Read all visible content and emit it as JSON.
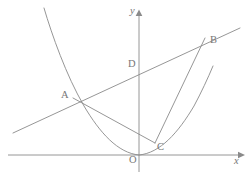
{
  "figure": {
    "background_color": "#ffffff",
    "stroke_color": "#8a8a8a",
    "label_color": "#777777"
  },
  "axes": {
    "x_label": "x",
    "y_label": "y",
    "origin_label": "O",
    "x_axis": {
      "y_px": 155,
      "x_start_px": 8,
      "x_end_px": 241
    },
    "y_axis": {
      "x_px": 139,
      "y_start_px": 12,
      "y_end_px": 172
    }
  },
  "points": [
    {
      "id": "A",
      "label": "A",
      "x_px": 73,
      "y_px": 98,
      "label_x_px": 61,
      "label_y_px": 90
    },
    {
      "id": "B",
      "label": "B",
      "x_px": 205,
      "y_px": 38,
      "label_x_px": 210,
      "label_y_px": 35
    },
    {
      "id": "C",
      "label": "C",
      "x_px": 155,
      "y_px": 143,
      "label_x_px": 157,
      "label_y_px": 142
    },
    {
      "id": "D",
      "label": "D",
      "x_px": 139,
      "y_px": 74,
      "label_x_px": 128,
      "label_y_px": 59
    },
    {
      "id": "O",
      "label": "O",
      "x_px": 139,
      "y_px": 155,
      "label_x_px": 129,
      "label_y_px": 155
    }
  ],
  "curves": [
    {
      "id": "parabola",
      "kind": "parabola",
      "description": "upward parabola with vertex at the origin",
      "path": "M 44 8 Q 61 62 84 106 Q 107 150 139 155 Q 171 150 194 106 Q 206 83 213 66"
    },
    {
      "id": "secant-AB",
      "kind": "line",
      "description": "line through A and B extended both directions",
      "path": "M 13 133 L 240 28"
    },
    {
      "id": "chord-AC",
      "kind": "segment",
      "description": "segment joining A and C",
      "path": "M 73 98 L 155 143"
    },
    {
      "id": "chord-BC",
      "kind": "segment",
      "description": "segment joining B and C",
      "path": "M 205 38 L 155 143"
    }
  ]
}
